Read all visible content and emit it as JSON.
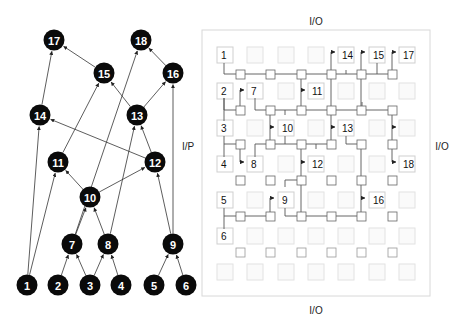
{
  "graph": {
    "nodes": [
      {
        "id": "1",
        "x": 27,
        "y": 285
      },
      {
        "id": "2",
        "x": 58,
        "y": 285
      },
      {
        "id": "3",
        "x": 90,
        "y": 285
      },
      {
        "id": "4",
        "x": 121,
        "y": 285
      },
      {
        "id": "5",
        "x": 154,
        "y": 285
      },
      {
        "id": "6",
        "x": 186,
        "y": 285
      },
      {
        "id": "7",
        "x": 72,
        "y": 244
      },
      {
        "id": "8",
        "x": 108,
        "y": 244
      },
      {
        "id": "9",
        "x": 173,
        "y": 244
      },
      {
        "id": "10",
        "x": 90,
        "y": 197
      },
      {
        "id": "11",
        "x": 58,
        "y": 162
      },
      {
        "id": "12",
        "x": 155,
        "y": 162
      },
      {
        "id": "13",
        "x": 137,
        "y": 115
      },
      {
        "id": "14",
        "x": 40,
        "y": 115
      },
      {
        "id": "15",
        "x": 104,
        "y": 73
      },
      {
        "id": "16",
        "x": 173,
        "y": 73
      },
      {
        "id": "17",
        "x": 54,
        "y": 40
      },
      {
        "id": "18",
        "x": 141,
        "y": 40
      }
    ],
    "edges": [
      [
        "1",
        "14"
      ],
      [
        "1",
        "11"
      ],
      [
        "2",
        "7"
      ],
      [
        "3",
        "7"
      ],
      [
        "3",
        "8"
      ],
      [
        "4",
        "8"
      ],
      [
        "5",
        "9"
      ],
      [
        "6",
        "9"
      ],
      [
        "7",
        "10"
      ],
      [
        "8",
        "10"
      ],
      [
        "7",
        "18"
      ],
      [
        "8",
        "13"
      ],
      [
        "9",
        "12"
      ],
      [
        "9",
        "16"
      ],
      [
        "10",
        "11"
      ],
      [
        "10",
        "12"
      ],
      [
        "11",
        "15"
      ],
      [
        "12",
        "14"
      ],
      [
        "12",
        "13"
      ],
      [
        "13",
        "15"
      ],
      [
        "13",
        "16"
      ],
      [
        "14",
        "17"
      ],
      [
        "15",
        "17"
      ],
      [
        "16",
        "18"
      ]
    ]
  },
  "fabric": {
    "labels": {
      "top": "I/O",
      "bottom": "I/O",
      "left": "I/P",
      "right": "I/O"
    },
    "cells": [
      {
        "row": 0,
        "col": 0,
        "label": "1"
      },
      {
        "row": 0,
        "col": 4,
        "label": "14",
        "arrow": true
      },
      {
        "row": 0,
        "col": 5,
        "label": "15",
        "arrow": true
      },
      {
        "row": 0,
        "col": 6,
        "label": "17",
        "arrow": true
      },
      {
        "row": 1,
        "col": 0,
        "label": "2"
      },
      {
        "row": 1,
        "col": 1,
        "label": "7",
        "arrow": true
      },
      {
        "row": 1,
        "col": 3,
        "label": "11",
        "arrow": true
      },
      {
        "row": 2,
        "col": 0,
        "label": "3"
      },
      {
        "row": 2,
        "col": 2,
        "label": "10",
        "arrow": true
      },
      {
        "row": 2,
        "col": 4,
        "label": "13",
        "arrow": true
      },
      {
        "row": 2,
        "col": 6,
        "label": "",
        "arrow": true
      },
      {
        "row": 3,
        "col": 0,
        "label": "4"
      },
      {
        "row": 3,
        "col": 1,
        "label": "8",
        "arrow": true
      },
      {
        "row": 3,
        "col": 3,
        "label": "12",
        "arrow": true
      },
      {
        "row": 3,
        "col": 6,
        "label": "18",
        "arrow": true
      },
      {
        "row": 4,
        "col": 0,
        "label": "5"
      },
      {
        "row": 4,
        "col": 2,
        "label": "9",
        "arrow": true
      },
      {
        "row": 4,
        "col": 5,
        "label": "16",
        "arrow": true
      },
      {
        "row": 5,
        "col": 0,
        "label": "6"
      }
    ]
  }
}
